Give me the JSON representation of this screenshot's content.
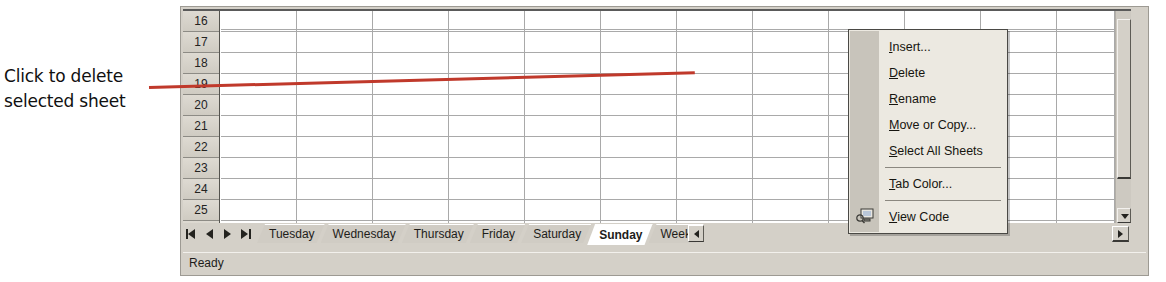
{
  "annotation": {
    "line1": "Click to delete",
    "line2": "selected sheet",
    "leader_color": "#c0392b"
  },
  "spreadsheet": {
    "row_headers": [
      "16",
      "17",
      "18",
      "19",
      "20",
      "21",
      "22",
      "23",
      "24",
      "25",
      "26"
    ],
    "column_count": 12
  },
  "context_menu": {
    "items": [
      {
        "label": "Insert...",
        "accel": "I",
        "icon": ""
      },
      {
        "label": "Delete",
        "accel": "D",
        "icon": ""
      },
      {
        "label": "Rename",
        "accel": "R",
        "icon": ""
      },
      {
        "label": "Move or Copy...",
        "accel": "M",
        "icon": ""
      },
      {
        "label": "Select All Sheets",
        "accel": "S",
        "icon": ""
      },
      {
        "label": "Tab Color...",
        "accel": "T",
        "icon": ""
      },
      {
        "label": "View Code",
        "accel": "V",
        "icon": "view-code-icon"
      }
    ]
  },
  "tabs": {
    "nav_buttons": [
      "first-sheet-button",
      "previous-sheet-button",
      "next-sheet-button",
      "last-sheet-button"
    ],
    "sheets": [
      {
        "label": "Tuesday",
        "active": false
      },
      {
        "label": "Wednesday",
        "active": false
      },
      {
        "label": "Thursday",
        "active": false
      },
      {
        "label": "Friday",
        "active": false
      },
      {
        "label": "Saturday",
        "active": false
      },
      {
        "label": "Sunday",
        "active": true
      },
      {
        "label": "Weekl",
        "active": false
      }
    ]
  },
  "status": {
    "text": "Ready"
  },
  "colors": {
    "chrome": "#d4d0c8",
    "grid_line": "#a9a9a9",
    "menu_bg": "#ece9e1",
    "accent_red": "#c0392b"
  }
}
